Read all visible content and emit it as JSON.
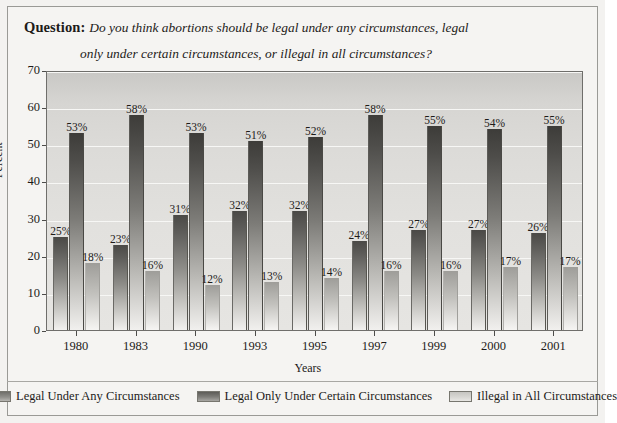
{
  "header": {
    "question_label": "Question:",
    "question_line_1": "Do you think abortions should be legal under any circumstances, legal",
    "question_line_2": "only under certain circumstances, or illegal in all circumstances?"
  },
  "axes": {
    "y_title": "Percent",
    "x_title": "Years",
    "y_ticks": [
      "0",
      "10",
      "20",
      "30",
      "40",
      "50",
      "60",
      "70"
    ],
    "x_ticks": [
      "1980",
      "1983",
      "1990",
      "1993",
      "1995",
      "1997",
      "1999",
      "2000",
      "2001"
    ]
  },
  "legend": {
    "items": [
      {
        "label": "Legal Under Any Circumstances",
        "color": "#6f6e6a"
      },
      {
        "label": "Legal Only Under Certain Circumstances",
        "color": "#5d5c58"
      },
      {
        "label": "Illegal in All Circumstances",
        "color": "#c6c5c1"
      }
    ]
  },
  "chart_data": {
    "type": "bar",
    "title": "Do you think abortions should be legal under any circumstances, legal only under certain circumstances, or illegal in all circumstances?",
    "xlabel": "Years",
    "ylabel": "Percent",
    "ylim": [
      0,
      70
    ],
    "ytick_step": 10,
    "grid": true,
    "legend_position": "bottom",
    "categories": [
      "1980",
      "1983",
      "1990",
      "1993",
      "1995",
      "1997",
      "1999",
      "2000",
      "2001"
    ],
    "series": [
      {
        "name": "Legal Under Any Circumstances",
        "values": [
          25,
          23,
          31,
          32,
          32,
          24,
          27,
          27,
          26
        ],
        "labels": [
          "25%",
          "23%",
          "31%",
          "32%",
          "32%",
          "24%",
          "27%",
          "27%",
          "26%"
        ]
      },
      {
        "name": "Legal Only Under Certain Circumstances",
        "values": [
          53,
          58,
          53,
          51,
          52,
          58,
          55,
          54,
          55
        ],
        "labels": [
          "53%",
          "58%",
          "53%",
          "51%",
          "52%",
          "58%",
          "55%",
          "54%",
          "55%"
        ]
      },
      {
        "name": "Illegal in All Circumstances",
        "values": [
          18,
          16,
          12,
          13,
          14,
          16,
          16,
          17,
          17
        ],
        "labels": [
          "18%",
          "16%",
          "12%",
          "13%",
          "14%",
          "16%",
          "16%",
          "17%",
          "17%"
        ]
      }
    ]
  }
}
